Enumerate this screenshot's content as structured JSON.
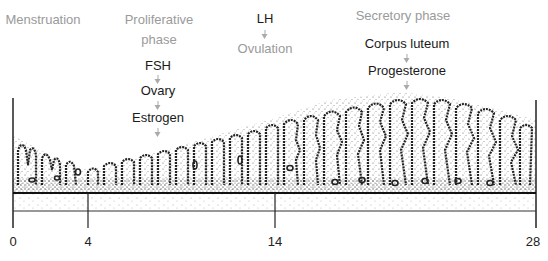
{
  "phases": {
    "menstruation": "Menstruation",
    "proliferative_line1": "Proliferative",
    "proliferative_line2": "phase",
    "secretory": "Secretory phase"
  },
  "hormone_chains": {
    "proliferative": [
      "FSH",
      "Ovary",
      "Estrogen"
    ],
    "ovulation": [
      "LH",
      "Ovulation"
    ],
    "secretory": [
      "Corpus luteum",
      "Progesterone"
    ]
  },
  "axis": {
    "ticks": [
      {
        "day": "0",
        "x": 13
      },
      {
        "day": "4",
        "x": 88
      },
      {
        "day": "14",
        "x": 275
      },
      {
        "day": "28",
        "x": 536
      }
    ]
  },
  "colors": {
    "label_gray": "#9a9a9a",
    "label_dark": "#1a1a1a",
    "line": "#222222",
    "arrow": "#aaaaaa"
  }
}
